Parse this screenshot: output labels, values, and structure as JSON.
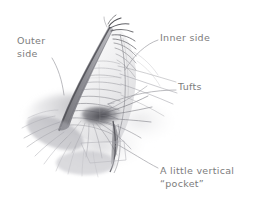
{
  "figure": {
    "kind": "pencil-sketch-diagram",
    "background_color": "#ffffff",
    "pencil_color": "#5b5b60",
    "label_color": "#7c7c7c"
  },
  "labels": {
    "outer_side": "Outer\nside",
    "inner_side": "Inner side",
    "tufts": "Tufts",
    "pocket": "A little vertical\n“pocket”"
  },
  "leader_lines": [
    {
      "name": "outer-side-leader",
      "from": [
        52,
        58
      ],
      "to": [
        64,
        95
      ]
    },
    {
      "name": "inner-side-leader",
      "from": [
        158,
        40
      ],
      "to": [
        125,
        70
      ]
    },
    {
      "name": "tufts-leader",
      "from": [
        176,
        90
      ],
      "to": [
        108,
        104
      ]
    },
    {
      "name": "pocket-leader",
      "from": [
        158,
        168
      ],
      "to": [
        113,
        142
      ]
    }
  ]
}
